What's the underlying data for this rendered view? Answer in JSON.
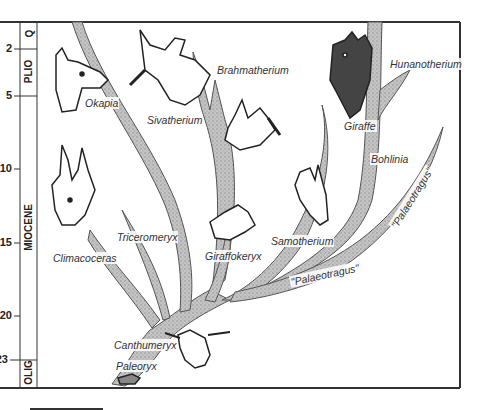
{
  "diagram": {
    "type": "phylogenetic-tree",
    "time_axis": {
      "unit": "million years ago",
      "ticks": [
        {
          "value": "2",
          "y": 49
        },
        {
          "value": "5",
          "y": 96
        },
        {
          "value": "10",
          "y": 169
        },
        {
          "value": "15",
          "y": 243
        },
        {
          "value": "20",
          "y": 316
        },
        {
          "value": "23",
          "y": 360
        }
      ]
    },
    "epochs": [
      {
        "label": "Q",
        "y_top": 22,
        "y_bottom": 49
      },
      {
        "label": "PLIO",
        "y_top": 49,
        "y_bottom": 96
      },
      {
        "label": "MIOCENE",
        "y_top": 96,
        "y_bottom": 360
      },
      {
        "label": "OLIG",
        "y_top": 360,
        "y_bottom": 388
      }
    ],
    "taxa": [
      {
        "name": "Okapia"
      },
      {
        "name": "Sivatherium"
      },
      {
        "name": "Brahmatherium"
      },
      {
        "name": "Hunanotherium"
      },
      {
        "name": "Giraffe"
      },
      {
        "name": "Bohlinia"
      },
      {
        "name": "Climacoceras"
      },
      {
        "name": "Triceromeryx"
      },
      {
        "name": "Giraffokeryx"
      },
      {
        "name": "Samotherium"
      },
      {
        "name": "\"Palaeotragus\""
      },
      {
        "name": "\"Palaeotragus\""
      },
      {
        "name": "Canthumeryx"
      },
      {
        "name": "Paleoryx"
      }
    ],
    "colors": {
      "branch_fill": "#b8b8b8",
      "branch_stroke": "#555555",
      "frame": "#333333",
      "text": "#333333"
    }
  }
}
